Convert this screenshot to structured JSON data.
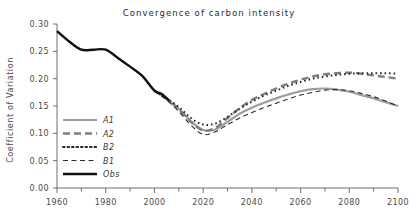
{
  "chart_data": {
    "type": "line",
    "title": "Convergence of carbon intensity",
    "xlabel": "",
    "ylabel": "Coefficient of Variation",
    "xlim": [
      1960,
      2100
    ],
    "ylim": [
      0.0,
      0.3
    ],
    "grid": false,
    "legend_position": "inner-left-lower",
    "xticks": [
      1960,
      1980,
      2000,
      2020,
      2040,
      2060,
      2080,
      2100
    ],
    "xtick_labels": [
      "1960",
      "1980",
      "2000",
      "2020",
      "2040",
      "2060",
      "2080",
      "2100"
    ],
    "xminor_ticks": [
      1970,
      1990,
      2010,
      2030,
      2050,
      2070,
      2090
    ],
    "yticks": [
      0.0,
      0.05,
      0.1,
      0.15,
      0.2,
      0.25,
      0.3
    ],
    "ytick_labels": [
      "0.00",
      "0.05",
      "0.10",
      "0.15",
      "0.20",
      "0.25",
      "0.30"
    ],
    "series": [
      {
        "name": "A1",
        "style": "solid",
        "color": "#9d9d9d",
        "width": 2.2,
        "dash": "",
        "x": [
          2000,
          2005,
          2010,
          2015,
          2020,
          2025,
          2030,
          2035,
          2040,
          2045,
          2050,
          2055,
          2060,
          2065,
          2070,
          2075,
          2080,
          2085,
          2090,
          2095,
          2100
        ],
        "y": [
          0.178,
          0.163,
          0.145,
          0.122,
          0.106,
          0.107,
          0.121,
          0.136,
          0.147,
          0.156,
          0.164,
          0.171,
          0.177,
          0.181,
          0.182,
          0.18,
          0.176,
          0.17,
          0.164,
          0.157,
          0.15
        ]
      },
      {
        "name": "A2",
        "style": "dashed",
        "color": "#7d7d7d",
        "width": 2.4,
        "dash": "7,4",
        "x": [
          2000,
          2005,
          2010,
          2015,
          2020,
          2025,
          2030,
          2035,
          2040,
          2045,
          2050,
          2055,
          2060,
          2065,
          2070,
          2075,
          2080,
          2085,
          2090,
          2095,
          2100
        ],
        "y": [
          0.178,
          0.163,
          0.144,
          0.121,
          0.105,
          0.11,
          0.128,
          0.146,
          0.161,
          0.172,
          0.182,
          0.191,
          0.198,
          0.204,
          0.208,
          0.21,
          0.211,
          0.209,
          0.206,
          0.203,
          0.2
        ]
      },
      {
        "name": "B2",
        "style": "dotted",
        "color": "#2a2a2a",
        "width": 2.0,
        "dash": "1.6,2.9",
        "x": [
          2000,
          2005,
          2010,
          2015,
          2020,
          2025,
          2030,
          2035,
          2040,
          2045,
          2050,
          2055,
          2060,
          2065,
          2070,
          2075,
          2080,
          2085,
          2090,
          2095,
          2100
        ],
        "y": [
          0.178,
          0.164,
          0.148,
          0.128,
          0.116,
          0.118,
          0.13,
          0.145,
          0.158,
          0.169,
          0.178,
          0.187,
          0.194,
          0.2,
          0.204,
          0.207,
          0.209,
          0.21,
          0.21,
          0.21,
          0.209
        ]
      },
      {
        "name": "B1",
        "style": "dashed-thin",
        "color": "#2a2a2a",
        "width": 1.1,
        "dash": "5,3.5",
        "x": [
          2000,
          2005,
          2010,
          2015,
          2020,
          2025,
          2030,
          2035,
          2040,
          2045,
          2050,
          2055,
          2060,
          2065,
          2070,
          2075,
          2080,
          2085,
          2090,
          2095,
          2100
        ],
        "y": [
          0.178,
          0.161,
          0.14,
          0.115,
          0.098,
          0.103,
          0.116,
          0.128,
          0.138,
          0.147,
          0.155,
          0.163,
          0.17,
          0.175,
          0.179,
          0.18,
          0.178,
          0.173,
          0.167,
          0.159,
          0.15
        ]
      },
      {
        "name": "Obs",
        "style": "solid",
        "color": "#111111",
        "width": 2.4,
        "dash": "",
        "x": [
          1960,
          1965,
          1970,
          1975,
          1980,
          1985,
          1990,
          1995,
          2000,
          2003,
          2006
        ],
        "y": [
          0.287,
          0.268,
          0.253,
          0.253,
          0.253,
          0.238,
          0.222,
          0.205,
          0.178,
          0.172,
          0.16
        ]
      }
    ]
  },
  "legend": {
    "items": [
      {
        "label": "A1"
      },
      {
        "label": "A2"
      },
      {
        "label": "B2"
      },
      {
        "label": "B1"
      },
      {
        "label": "Obs"
      }
    ]
  }
}
